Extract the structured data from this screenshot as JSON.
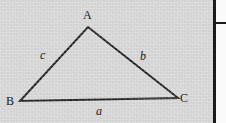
{
  "figure": {
    "name": "labeled-triangle",
    "background_color": "#d6d6d6",
    "stroke_color": "#1b1b1b",
    "text_color": "#1a1a1a",
    "width": 226,
    "height": 123,
    "vertices": [
      {
        "key": "A",
        "label": "A",
        "x": 88,
        "y": 27,
        "label_x": 83,
        "label_y": 9
      },
      {
        "key": "B",
        "label": "B",
        "x": 20,
        "y": 101,
        "label_x": 6,
        "label_y": 95
      },
      {
        "key": "C",
        "label": "C",
        "x": 178,
        "y": 98,
        "label_x": 180,
        "label_y": 92
      }
    ],
    "sides": [
      {
        "key": "a",
        "label": "a",
        "from": "B",
        "to": "C",
        "label_x": 96,
        "label_y": 105
      },
      {
        "key": "b",
        "label": "b",
        "from": "A",
        "to": "C",
        "label_x": 140,
        "label_y": 50
      },
      {
        "key": "c",
        "label": "c",
        "from": "B",
        "to": "A",
        "label_x": 40,
        "label_y": 49
      }
    ]
  },
  "right_margin": {
    "rule_label": "vertical-rule",
    "tick_label": "margin-tick"
  },
  "chart_data": {
    "type": "diagram",
    "title": "",
    "points": {
      "A": [
        88,
        27
      ],
      "B": [
        20,
        101
      ],
      "C": [
        178,
        98
      ]
    },
    "edges": [
      {
        "name": "a",
        "endpoints": [
          "B",
          "C"
        ]
      },
      {
        "name": "b",
        "endpoints": [
          "A",
          "C"
        ]
      },
      {
        "name": "c",
        "endpoints": [
          "B",
          "A"
        ]
      }
    ],
    "vertex_labels": [
      "A",
      "B",
      "C"
    ],
    "edge_labels": [
      "a",
      "b",
      "c"
    ]
  }
}
